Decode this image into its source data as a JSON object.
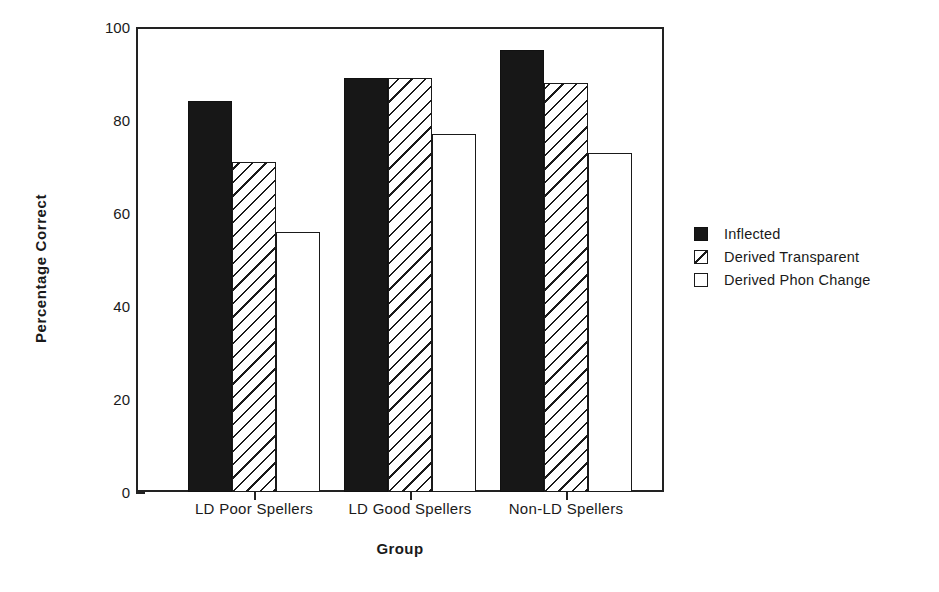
{
  "chart_data": {
    "type": "bar",
    "title": "",
    "xlabel": "Group",
    "ylabel": "Percentage  Correct",
    "categories": [
      "LD Poor Spellers",
      "LD Good Spellers",
      "Non-LD Spellers"
    ],
    "series": [
      {
        "name": "Inflected",
        "values": [
          84,
          89,
          95
        ],
        "fill": "solid-black",
        "color": "#171717"
      },
      {
        "name": "Derived Transparent",
        "values": [
          71,
          89,
          88
        ],
        "fill": "diagonal-hatch",
        "color": "#ffffff"
      },
      {
        "name": "Derived Phon Change",
        "values": [
          56,
          77,
          73
        ],
        "fill": "open-white",
        "color": "#ffffff"
      }
    ],
    "ylim": [
      0,
      100
    ],
    "ymajor_ticks": [
      0,
      20,
      40,
      60,
      80,
      100
    ],
    "yminor_ticks": [
      10,
      30,
      50,
      70,
      90
    ],
    "ytick_labels": [
      "0",
      "20",
      "40",
      "60",
      "80",
      "100"
    ],
    "grid": false,
    "legend_position": "right"
  },
  "axis": {
    "y_title": "Percentage  Correct",
    "x_title": "Group",
    "y_labels": [
      "100",
      "80",
      "60",
      "40",
      "20",
      "0"
    ],
    "x_labels": [
      "LD Poor Spellers",
      "LD Good Spellers",
      "Non-LD Spellers"
    ]
  },
  "legend": {
    "items": [
      {
        "label": "Inflected",
        "swatch": "solid-black-square-icon"
      },
      {
        "label": "Derived Transparent",
        "swatch": "hatched-square-icon"
      },
      {
        "label": "Derived Phon Change",
        "swatch": "open-square-icon"
      }
    ]
  }
}
